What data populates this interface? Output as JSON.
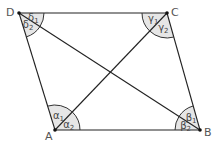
{
  "diagram": {
    "type": "parallelogram-with-diagonals",
    "vertices": [
      {
        "id": "A",
        "label": "A"
      },
      {
        "id": "B",
        "label": "B"
      },
      {
        "id": "C",
        "label": "C"
      },
      {
        "id": "D",
        "label": "D"
      }
    ],
    "sides": [
      "AB",
      "BC",
      "CD",
      "DA"
    ],
    "diagonals": [
      "AC",
      "BD"
    ],
    "angles": [
      {
        "vertex": "A",
        "label": "α1",
        "between": [
          "AD",
          "AC"
        ]
      },
      {
        "vertex": "A",
        "label": "α2",
        "between": [
          "AC",
          "AB"
        ]
      },
      {
        "vertex": "B",
        "label": "β1",
        "between": [
          "BC",
          "BD"
        ]
      },
      {
        "vertex": "B",
        "label": "β2",
        "between": [
          "BD",
          "BA"
        ]
      },
      {
        "vertex": "C",
        "label": "γ1",
        "between": [
          "CD",
          "CA"
        ]
      },
      {
        "vertex": "C",
        "label": "γ2",
        "between": [
          "CA",
          "CB"
        ]
      },
      {
        "vertex": "D",
        "label": "δ1",
        "between": [
          "DC",
          "DB"
        ]
      },
      {
        "vertex": "D",
        "label": "δ2",
        "between": [
          "DB",
          "DA"
        ]
      }
    ],
    "colors": {
      "line": "#222222",
      "angle_fill": "#e6e6e6",
      "label": "#555555"
    }
  }
}
